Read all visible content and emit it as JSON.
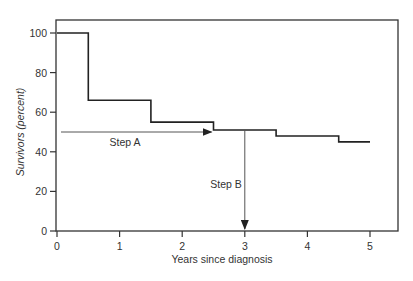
{
  "chart_data": {
    "type": "line",
    "subtype": "step",
    "title": "",
    "xlabel": "Years since diagnosis",
    "ylabel": "Survivors (percent)",
    "xlim": [
      0,
      5.7
    ],
    "ylim": [
      0,
      105
    ],
    "x_ticks": [
      0,
      1,
      2,
      3,
      4,
      5
    ],
    "y_ticks": [
      0,
      20,
      40,
      60,
      80,
      100
    ],
    "grid": false,
    "legend": null,
    "series": [
      {
        "name": "Survival curve",
        "x": [
          0,
          0.5,
          1.5,
          2.5,
          3.5,
          4.5,
          5
        ],
        "values": [
          100,
          66,
          55,
          51,
          48,
          45,
          45
        ]
      }
    ],
    "annotations": [
      {
        "label": "Step A",
        "type": "arrow",
        "from": [
          0,
          50
        ],
        "to": [
          2.5,
          50
        ],
        "direction": "right"
      },
      {
        "label": "Step B",
        "type": "arrow",
        "from": [
          3,
          51
        ],
        "to": [
          3,
          0
        ],
        "direction": "down"
      }
    ]
  }
}
